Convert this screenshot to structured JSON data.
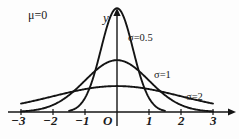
{
  "figure": {
    "mu_annotation": "μ=0",
    "y_axis_label": "y",
    "origin_label": "O"
  },
  "axis": {
    "x_ticks": [
      "−3",
      "−2",
      "−1",
      "1",
      "2",
      "3"
    ],
    "x_tick_values": [
      -3,
      -2,
      -1,
      1,
      2,
      3
    ]
  },
  "curves": [
    {
      "label": "σ=0.5",
      "sigma": 0.5,
      "color": "#141414"
    },
    {
      "label": "σ=1",
      "sigma": 1,
      "color": "#141414"
    },
    {
      "label": "σ=2",
      "sigma": 2,
      "color": "#141414"
    }
  ],
  "chart_data": {
    "type": "line",
    "title": "",
    "subtitle": "",
    "xlabel": "",
    "ylabel": "y",
    "annotations": [
      "μ=0"
    ],
    "grid": false,
    "legend": "inline-curve-labels",
    "xlim": [
      -3,
      3
    ],
    "ylim": [
      0,
      0.8
    ],
    "x_ticks": [
      -3,
      -2,
      -1,
      0,
      1,
      2,
      3
    ],
    "x_tick_labels": [
      "−3",
      "−2",
      "−1",
      "O",
      "1",
      "2",
      "3"
    ],
    "y_ticks": [],
    "function": "normal probability density: f(x) = 1/(sigma*sqrt(2*pi)) * exp(-(x-mu)^2/(2*sigma^2)), mu = 0",
    "series": [
      {
        "name": "σ=0.5",
        "sigma": 0.5,
        "mu": 0,
        "peak_value": 0.798,
        "x_range": [
          -1.5,
          1.5
        ],
        "x": [
          -1.5,
          -1.25,
          -1.0,
          -0.75,
          -0.5,
          -0.25,
          0,
          0.25,
          0.5,
          0.75,
          1.0,
          1.25,
          1.5
        ],
        "values": [
          0.009,
          0.035,
          0.108,
          0.264,
          0.484,
          0.704,
          0.798,
          0.704,
          0.484,
          0.264,
          0.108,
          0.035,
          0.009
        ]
      },
      {
        "name": "σ=1",
        "sigma": 1,
        "mu": 0,
        "peak_value": 0.399,
        "x_range": [
          -3,
          3
        ],
        "x": [
          -3,
          -2.5,
          -2,
          -1.5,
          -1,
          -0.5,
          0,
          0.5,
          1,
          1.5,
          2,
          2.5,
          3
        ],
        "values": [
          0.004,
          0.018,
          0.054,
          0.13,
          0.242,
          0.352,
          0.399,
          0.352,
          0.242,
          0.13,
          0.054,
          0.018,
          0.004
        ]
      },
      {
        "name": "σ=2",
        "sigma": 2,
        "mu": 0,
        "peak_value": 0.199,
        "x_range": [
          -3,
          3
        ],
        "x": [
          -3,
          -2.5,
          -2,
          -1.5,
          -1,
          -0.5,
          0,
          0.5,
          1,
          1.5,
          2,
          2.5,
          3
        ],
        "values": [
          0.065,
          0.091,
          0.121,
          0.151,
          0.176,
          0.193,
          0.199,
          0.193,
          0.176,
          0.151,
          0.121,
          0.091,
          0.065
        ]
      }
    ]
  }
}
